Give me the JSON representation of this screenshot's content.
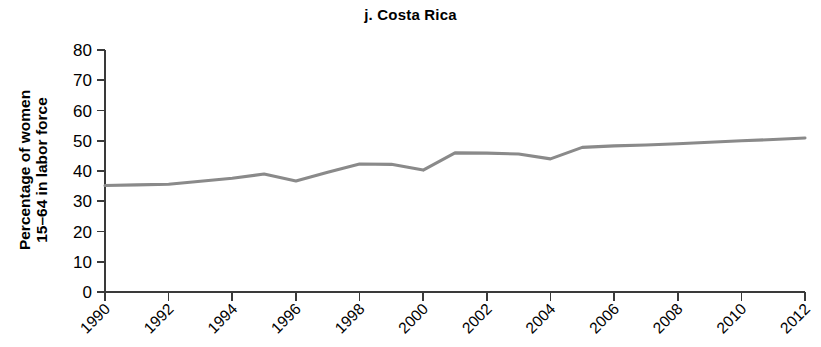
{
  "chart_data": {
    "type": "line",
    "title": "j. Costa Rica",
    "xlabel": "",
    "ylabel": "Percentage of women 15–64 in labor force",
    "ylabel_line1": "Percentage of women",
    "ylabel_line2": "15–64 in labor force",
    "x": [
      1990,
      1991,
      1992,
      1993,
      1994,
      1995,
      1996,
      1997,
      1998,
      1999,
      2000,
      2001,
      2002,
      2003,
      2004,
      2005,
      2006,
      2007,
      2008,
      2009,
      2010,
      2011,
      2012
    ],
    "values": [
      35.2,
      35.4,
      35.6,
      36.6,
      37.6,
      39.0,
      36.7,
      39.6,
      42.3,
      42.2,
      40.3,
      46.0,
      45.9,
      45.6,
      44.0,
      47.8,
      48.3,
      48.6,
      49.0,
      49.5,
      50.0,
      50.4,
      50.9
    ],
    "series": [
      {
        "name": "Costa Rica",
        "values": [
          35.2,
          35.4,
          35.6,
          36.6,
          37.6,
          39.0,
          36.7,
          39.6,
          42.3,
          42.2,
          40.3,
          46.0,
          45.9,
          45.6,
          44.0,
          47.8,
          48.3,
          48.6,
          49.0,
          49.5,
          50.0,
          50.4,
          50.9
        ],
        "color": "#8a8a8a"
      }
    ],
    "xlim": [
      1990,
      2012
    ],
    "ylim": [
      0,
      80
    ],
    "ytick_labels": [
      "0",
      "10",
      "20",
      "30",
      "40",
      "50",
      "60",
      "70",
      "80"
    ],
    "ytick_values": [
      0,
      10,
      20,
      30,
      40,
      50,
      60,
      70,
      80
    ],
    "xtick_labels": [
      "1990",
      "1992",
      "1994",
      "1996",
      "1998",
      "2000",
      "2002",
      "2004",
      "2006",
      "2008",
      "2010",
      "2012"
    ],
    "xtick_values": [
      1990,
      1992,
      1994,
      1996,
      1998,
      2000,
      2002,
      2004,
      2006,
      2008,
      2010,
      2012
    ],
    "grid": false,
    "legend": false,
    "line_color": "#8a8a8a",
    "axis_color": "#3a3a3a"
  }
}
